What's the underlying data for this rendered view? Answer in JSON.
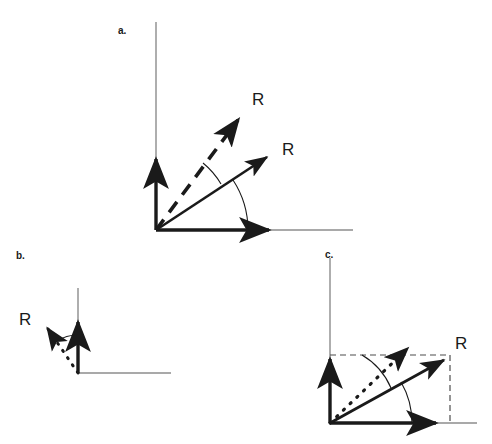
{
  "figure": {
    "type": "vector-diagram",
    "background_color": "#ffffff",
    "stroke_color": "#1a1a1a",
    "axis_color": "#8c8c8c",
    "width": 492,
    "height": 444,
    "panel_count": 3
  },
  "panels": {
    "a": {
      "label": "a.",
      "origin": [
        156,
        230
      ],
      "axes": {
        "y_axis_thin_top": 22,
        "x_axis_thin_right": 352,
        "y_arrow_tip": [
          156,
          155
        ],
        "x_arrow_tip": [
          275,
          230
        ]
      },
      "vectors": [
        {
          "name": "resultant-dashed",
          "label": "R",
          "style": "dashed",
          "angle_deg": 53,
          "tip": [
            243,
            113
          ],
          "label_position": [
            252,
            91
          ]
        },
        {
          "name": "resultant-solid",
          "label": "R",
          "style": "solid",
          "angle_deg": 33,
          "tip": [
            272,
            152
          ],
          "label_position": [
            282,
            141
          ]
        }
      ],
      "arcs": [
        {
          "name": "angle-arc-outer",
          "radius": 92,
          "from_deg": 0,
          "to_deg": 33
        },
        {
          "name": "angle-arc-inner",
          "radius": 78,
          "from_deg": 33,
          "to_deg": 53
        }
      ]
    },
    "b": {
      "label": "b.",
      "origin": [
        78,
        373
      ],
      "axes": {
        "y_axis_thin_top": 288,
        "x_axis_thin_right": 170,
        "y_arrow_tip": [
          78,
          318
        ]
      },
      "vectors": [
        {
          "name": "resultant-dotted",
          "label": "R",
          "style": "dotted",
          "angle_deg": 124,
          "tip": [
            41,
            319
          ],
          "label_position": [
            19,
            311
          ]
        }
      ],
      "arcs": [
        {
          "name": "angle-arc",
          "radius": 38,
          "from_deg": 90,
          "to_deg": 124
        }
      ]
    },
    "c": {
      "label": "c.",
      "origin": [
        330,
        423
      ],
      "axes": {
        "y_axis_thin_top": 258,
        "x_axis_thin_right": 476,
        "y_arrow_tip": [
          330,
          355
        ],
        "x_arrow_tip": [
          442,
          423
        ]
      },
      "vectors": [
        {
          "name": "resultant-solid",
          "label": "R",
          "style": "solid",
          "angle_deg": 30,
          "tip": [
            450,
            355
          ],
          "label_position": [
            455,
            335
          ]
        },
        {
          "name": "resultant-dotted",
          "label": "",
          "style": "dotted",
          "angle_deg": 63,
          "tip": [
            404,
            344
          ],
          "label_position": null
        }
      ],
      "projection_lines": [
        {
          "name": "horizontal-projection",
          "style": "dashed",
          "from": [
            330,
            355
          ],
          "to": [
            450,
            355
          ]
        },
        {
          "name": "vertical-projection",
          "style": "dashed",
          "from": [
            450,
            355
          ],
          "to": [
            450,
            423
          ]
        }
      ],
      "arcs": [
        {
          "name": "angle-arc-outer",
          "radius": 82,
          "from_deg": 0,
          "to_deg": 30
        },
        {
          "name": "angle-arc-inner",
          "radius": 70,
          "from_deg": 30,
          "to_deg": 63
        }
      ]
    }
  }
}
